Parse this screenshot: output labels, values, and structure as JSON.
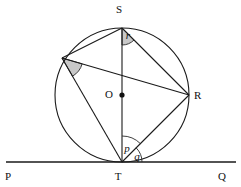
{
  "figure": {
    "type": "circle-geometry-diagram",
    "background_color": "#ffffff",
    "line_color": "#1a1a1a",
    "shade_color": "#c8c8c8",
    "canvas": {
      "width": 241,
      "height": 187
    }
  },
  "circle": {
    "label": "circle",
    "center_x": 122,
    "center_y": 95,
    "radius": 67
  },
  "center_point": {
    "label": "O",
    "x": 122,
    "y": 95,
    "label_x": 109,
    "label_y": 98
  },
  "points": [
    {
      "name": "S",
      "label": "S",
      "x": 122,
      "y": 28,
      "label_x": 119,
      "label_y": 13
    },
    {
      "name": "R",
      "label": "R",
      "x": 189,
      "y": 95,
      "label_x": 194,
      "label_y": 99
    },
    {
      "name": "T",
      "label": "T",
      "x": 122,
      "y": 162,
      "label_x": 118,
      "label_y": 180
    },
    {
      "name": "U",
      "label": "",
      "x": 62,
      "y": 58,
      "label_x": 0,
      "label_y": 0
    },
    {
      "name": "P",
      "label": "P",
      "x": 10,
      "y": 162,
      "label_x": 8,
      "label_y": 180
    },
    {
      "name": "Q",
      "label": "Q",
      "x": 231,
      "y": 162,
      "label_x": 222,
      "label_y": 180
    }
  ],
  "tangent_line": {
    "name": "PQ",
    "from_label": "P",
    "to_label": "Q",
    "x1": 6,
    "y1": 162,
    "x2": 236,
    "y2": 162,
    "touch_point": "T"
  },
  "segments": [
    {
      "name": "ST",
      "from": "S",
      "to": "T"
    },
    {
      "name": "SR",
      "from": "S",
      "to": "R"
    },
    {
      "name": "TR",
      "from": "T",
      "to": "R"
    },
    {
      "name": "UR",
      "from": "U",
      "to": "R"
    },
    {
      "name": "UT",
      "from": "U",
      "to": "T"
    },
    {
      "name": "US",
      "from": "U",
      "to": "S"
    }
  ],
  "angles": [
    {
      "label": "p",
      "vertex": "T",
      "between": [
        "TS",
        "TR"
      ],
      "shaded": false,
      "label_x": 127,
      "label_y": 152,
      "arc_radius": 26
    },
    {
      "label": "q",
      "vertex": "T",
      "between": [
        "TR",
        "TQ"
      ],
      "shaded": false,
      "label_x": 137,
      "label_y": 160,
      "arc_radius": 20
    },
    {
      "label": "r",
      "vertex": "S",
      "between": [
        "ST",
        "SR"
      ],
      "shaded": true,
      "label_x": 128,
      "label_y": 39,
      "arc_radius": 17
    },
    {
      "label": "",
      "vertex": "U",
      "between": [
        "UT",
        "UR"
      ],
      "shaded": true,
      "label_x": 0,
      "label_y": 0,
      "arc_radius": 21
    }
  ]
}
